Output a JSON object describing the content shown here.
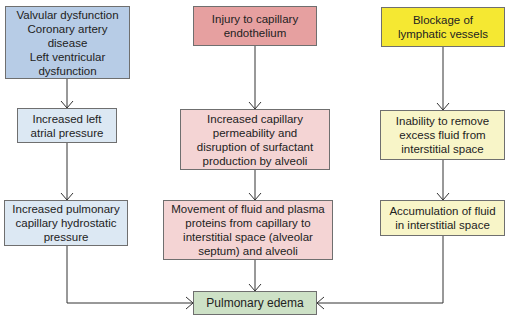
{
  "diagram": {
    "colors": {
      "cardiac_header": "#b7cce6",
      "cardiac_step": "#dce8f3",
      "capillary_header": "#e6a0a0",
      "capillary_step": "#f4d4d4",
      "lymphatic_header": "#f5e832",
      "lymphatic_step": "#f8f5c8",
      "outcome": "#cde1c6",
      "arrow": "#333333"
    },
    "columns": [
      {
        "name": "cardiac",
        "nodes": [
          {
            "label": "Valvular dysfunction\nCoronary artery\ndisease\nLeft ventricular\ndysfunction"
          },
          {
            "label": "Increased left\natrial pressure"
          },
          {
            "label": "Increased pulmonary\ncapillary hydrostatic\npressure"
          }
        ]
      },
      {
        "name": "capillary",
        "nodes": [
          {
            "label": "Injury to capillary\nendothelium"
          },
          {
            "label": "Increased capillary\npermeability and\ndisruption of surfactant\nproduction by alveoli"
          },
          {
            "label": "Movement of fluid and plasma\nproteins from capillary to\ninterstitial space (alveolar\nseptum) and alveoli"
          }
        ]
      },
      {
        "name": "lymphatic",
        "nodes": [
          {
            "label": "Blockage of\nlymphatic vessels"
          },
          {
            "label": "Inability to remove\nexcess fluid from\ninterstitial space"
          },
          {
            "label": "Accumulation of fluid\nin interstitial space"
          }
        ]
      }
    ],
    "outcome": {
      "label": "Pulmonary edema"
    }
  }
}
